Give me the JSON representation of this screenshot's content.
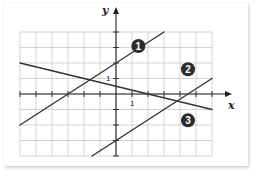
{
  "chart_data": {
    "type": "line",
    "title": "",
    "xlabel": "x",
    "ylabel": "y",
    "xlim": [
      -6,
      6
    ],
    "ylim": [
      -4,
      4
    ],
    "grid": true,
    "tick_labels": {
      "x": [
        "1"
      ],
      "y": [
        "1"
      ]
    },
    "tick_label_values": {
      "x": [
        1
      ],
      "y": [
        1
      ]
    },
    "series": [
      {
        "name": "1",
        "label": "1",
        "x": [
          -6,
          3
        ],
        "y": [
          -2,
          4
        ],
        "equation": "y = (2/3)x + 2",
        "label_at": [
          1.4,
          3.1
        ]
      },
      {
        "name": "2",
        "label": "2",
        "x": [
          -1.5,
          6
        ],
        "y": [
          -4,
          1
        ],
        "equation": "y = (2/3)x - 3",
        "label_at": [
          4.5,
          1.6
        ]
      },
      {
        "name": "3",
        "label": "3",
        "x": [
          -6,
          6
        ],
        "y": [
          2,
          -1
        ],
        "equation": "y = -(1/4)x + 1/2",
        "label_at": [
          4.5,
          -1.7
        ]
      }
    ]
  },
  "colors": {
    "grid": "#c9c9c9",
    "axis": "#231f20",
    "line": "#333333",
    "badge": "#2b2b2b"
  }
}
